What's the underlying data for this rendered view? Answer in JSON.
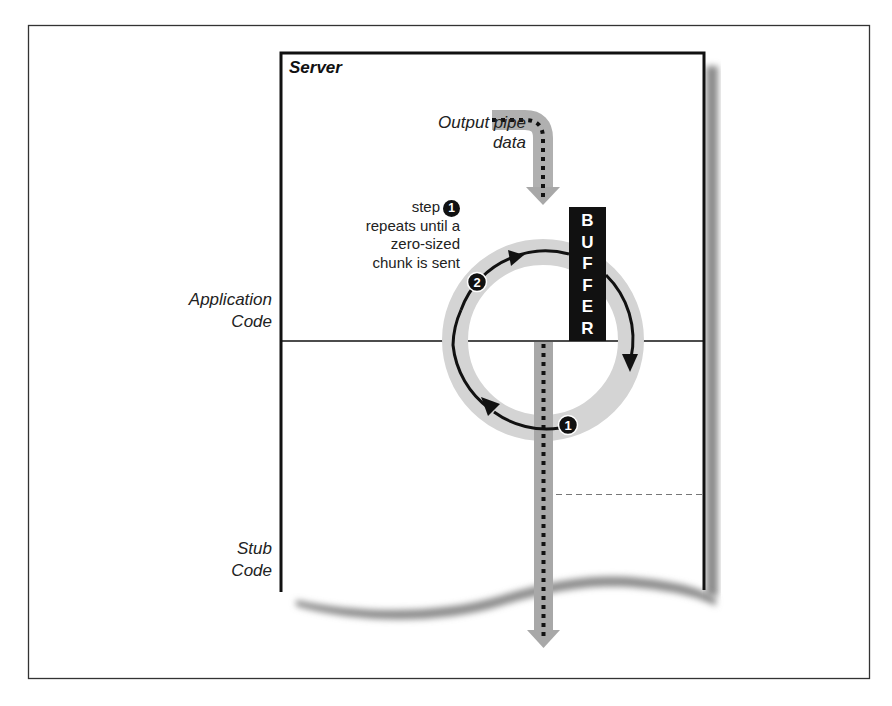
{
  "diagram": {
    "server_title": "Server",
    "input_label_line1": "Output pipe",
    "input_label_line2": "data",
    "step_note": {
      "line1": "step",
      "step_badge": "1",
      "line2": "repeats until a",
      "line3": "zero-sized",
      "line4": "chunk is sent"
    },
    "buffer_label": [
      "B",
      "U",
      "F",
      "F",
      "E",
      "R"
    ],
    "layers": [
      {
        "line1": "Application",
        "line2": "Code"
      },
      {
        "line1": "Stub",
        "line2": "Code"
      }
    ],
    "cycle_steps": [
      {
        "badge": "1",
        "position": "bottom of loop, beside outgoing pipe"
      },
      {
        "badge": "2",
        "position": "upper-left of loop"
      }
    ],
    "colors": {
      "ink": "#111111",
      "pipe_gray": "#a8a8a8",
      "ring_gray": "#d4d4d4",
      "shadow_gray": "#8c8c8c",
      "frame": "#333333"
    }
  }
}
